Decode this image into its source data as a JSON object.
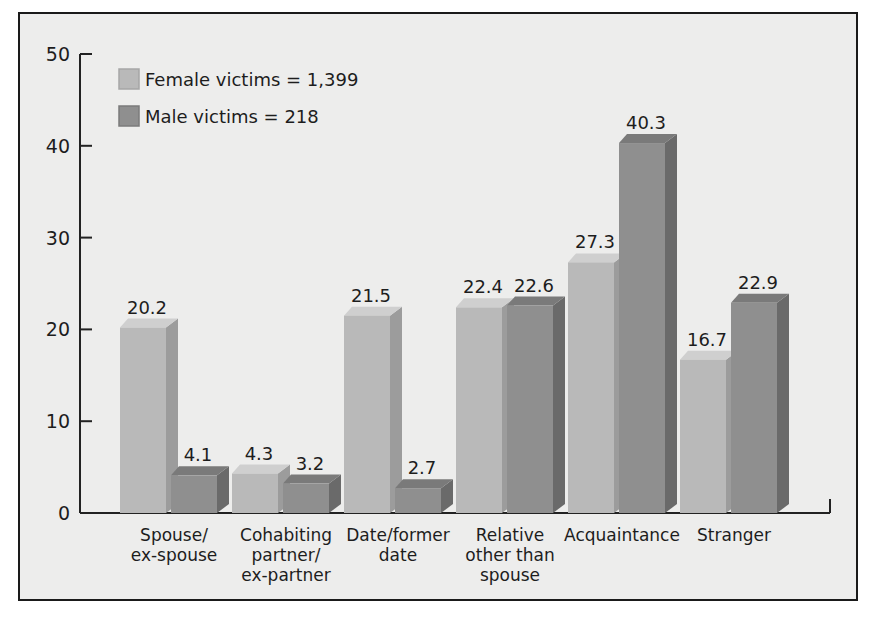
{
  "chart_data": {
    "type": "bar",
    "title": "",
    "xlabel": "",
    "ylabel": "",
    "ylim": [
      0,
      50
    ],
    "yticks": [
      0,
      10,
      20,
      30,
      40,
      50
    ],
    "grid": false,
    "legend_position": "top-left",
    "categories": [
      [
        "Spouse/",
        "ex-spouse"
      ],
      [
        "Cohabiting",
        "partner/",
        "ex-partner"
      ],
      [
        "Date/former",
        "date"
      ],
      [
        "Relative",
        "other than",
        "spouse"
      ],
      [
        "Acquaintance"
      ],
      [
        "Stranger"
      ]
    ],
    "series": [
      {
        "name": "Female victims = 1,399",
        "color": "#b9b9b9",
        "values": [
          20.2,
          4.3,
          21.5,
          22.4,
          27.3,
          16.7
        ]
      },
      {
        "name": "Male victims = 218",
        "color": "#8f8f8f",
        "values": [
          4.1,
          3.2,
          2.7,
          22.6,
          40.3,
          22.9
        ]
      }
    ]
  },
  "colors": {
    "background": "#ededec",
    "frame": "#1a1a1a",
    "axis": "#222222",
    "female_front": "#b9b9b9",
    "female_top": "#cfcfcf",
    "female_side": "#9c9c9c",
    "male_front": "#8f8f8f",
    "male_top": "#7a7a7a",
    "male_side": "#6a6a6a"
  }
}
